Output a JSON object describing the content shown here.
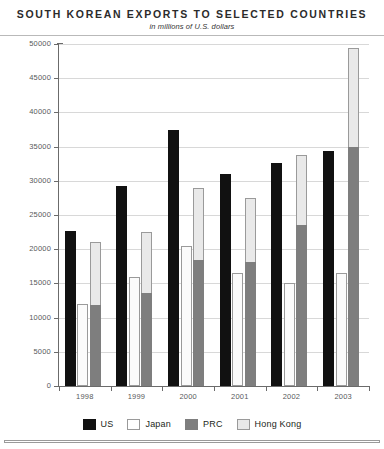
{
  "chart_data": {
    "type": "bar",
    "title": "SOUTH KOREAN EXPORTS TO SELECTED COUNTRIES",
    "subtitle": "in millions of U.S. dollars",
    "xlabel": "",
    "ylabel": "",
    "grid": true,
    "legend_position": "bottom",
    "ylim": [
      0,
      50000
    ],
    "yticks": [
      0,
      5000,
      10000,
      15000,
      20000,
      25000,
      30000,
      35000,
      40000,
      45000,
      50000
    ],
    "ytick_labels": [
      "0",
      "5000",
      "10000",
      "15000",
      "20000",
      "25000",
      "30000",
      "35000",
      "40000",
      "45000",
      "50000"
    ],
    "categories": [
      "1998",
      "1999",
      "2000",
      "2001",
      "2002",
      "2003"
    ],
    "note": "PRC and Hong Kong are drawn as one stacked column per year; the Hong Kong value shown is the stack top.",
    "series": [
      {
        "name": "US",
        "color": "#111111",
        "values": [
          22700,
          29300,
          37500,
          31000,
          32600,
          34400
        ]
      },
      {
        "name": "Japan",
        "color": "#ffffff",
        "values": [
          12000,
          15900,
          20400,
          16500,
          15000,
          16500
        ]
      },
      {
        "name": "PRC",
        "color": "#7e7e7e",
        "values": [
          11900,
          13600,
          18400,
          18200,
          23500,
          35000
        ]
      },
      {
        "name": "Hong Kong",
        "color": "#e9e9e9",
        "values": [
          21000,
          22500,
          29000,
          27500,
          33800,
          49400
        ]
      }
    ]
  },
  "legend": {
    "items": [
      {
        "label": "US"
      },
      {
        "label": "Japan"
      },
      {
        "label": "PRC"
      },
      {
        "label": "Hong Kong"
      }
    ]
  },
  "colors": {
    "us": "#111111",
    "japan": "#ffffff",
    "prc": "#7e7e7e",
    "hong_kong": "#e9e9e9",
    "axis": "#6b6b6b",
    "grid": "#d8d8d8",
    "tick_text": "#58595b"
  }
}
